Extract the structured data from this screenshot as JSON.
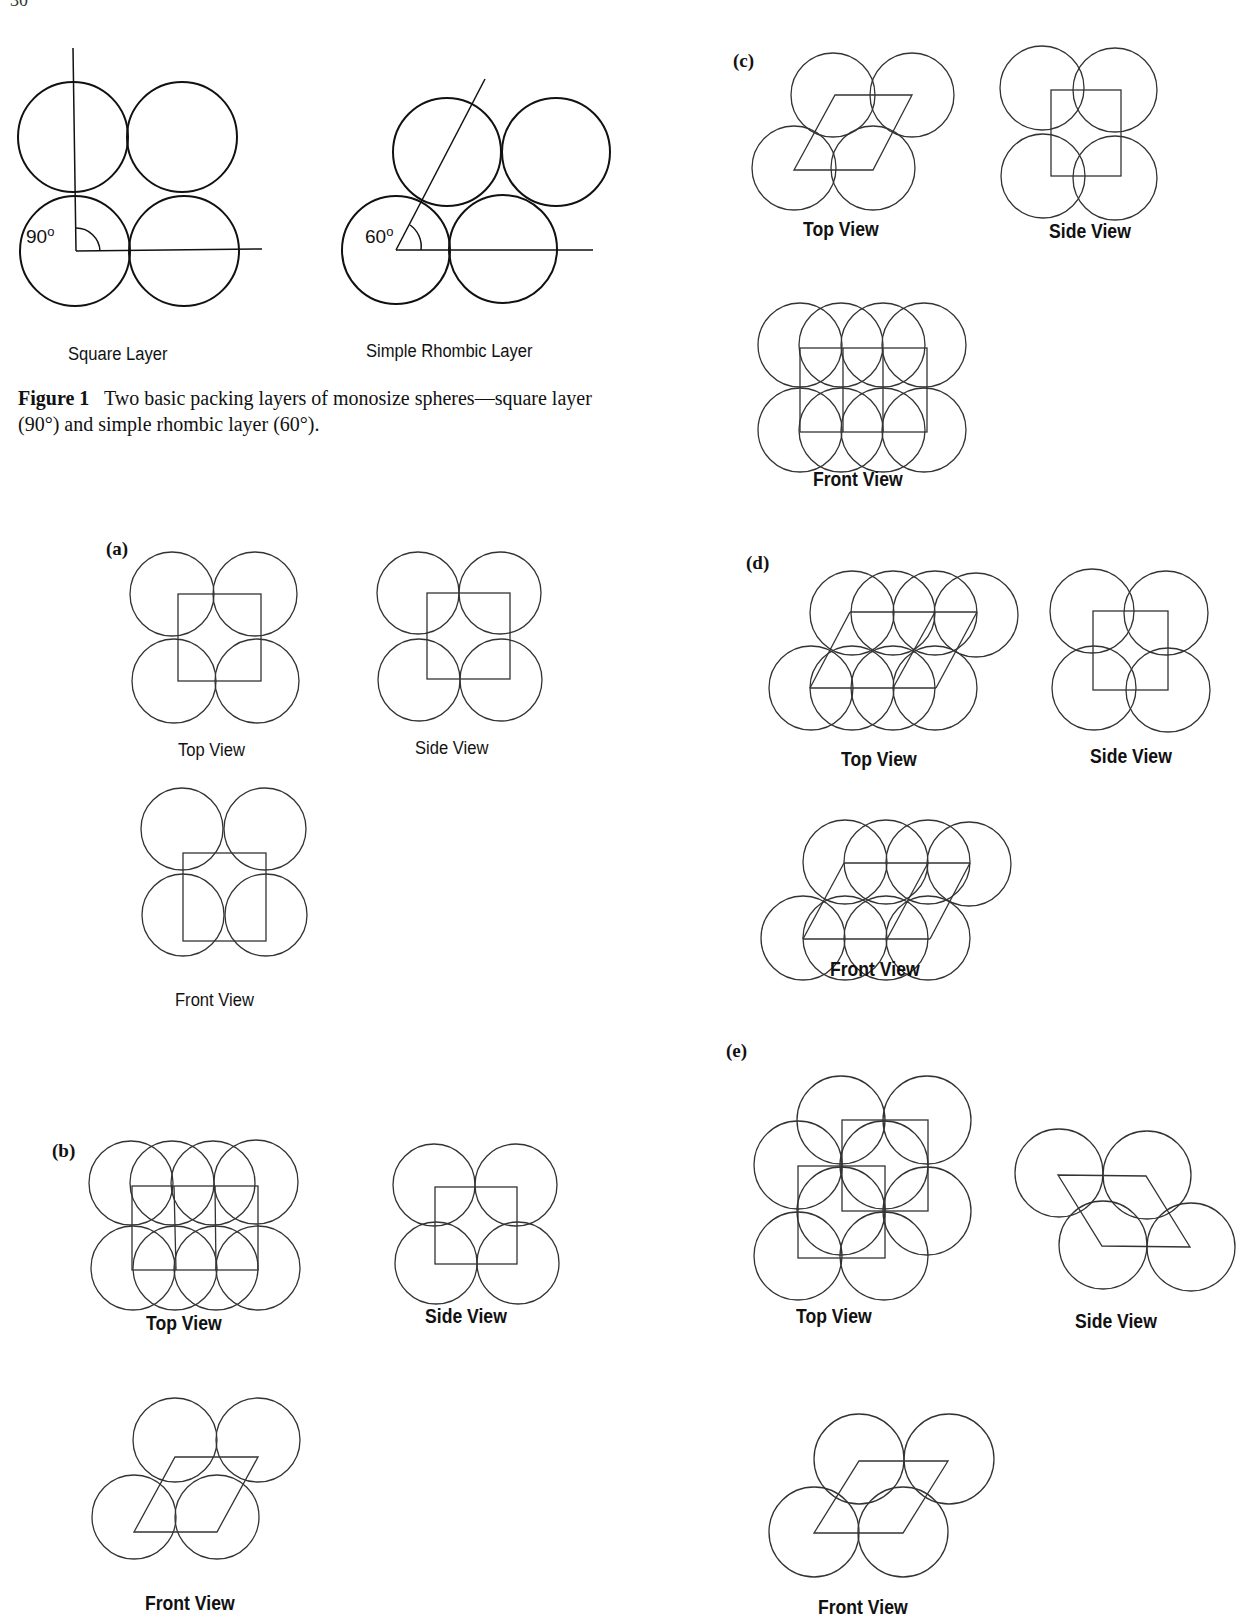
{
  "page": {
    "number": "30"
  },
  "figure1": {
    "square_layer": {
      "label": "Square Layer",
      "angle": "90",
      "degree_symbol": "o"
    },
    "rhombic_layer": {
      "label": "Simple Rhombic Layer",
      "angle": "60",
      "degree_symbol": "o"
    },
    "caption": {
      "label": "Figure 1",
      "text": "Two basic packing layers of monosize spheres—square layer (90°) and simple rhombic layer (60°)."
    }
  },
  "figure2": {
    "panels": [
      {
        "id": "a",
        "tag": "(a)",
        "views": {
          "top": "Top View",
          "side": "Side View",
          "front": "Front View"
        }
      },
      {
        "id": "b",
        "tag": "(b)",
        "views": {
          "top": "Top View",
          "side": "Side View",
          "front": "Front View"
        }
      },
      {
        "id": "c",
        "tag": "(c)",
        "views": {
          "top": "Top View",
          "side": "Side View",
          "front": "Front View"
        }
      },
      {
        "id": "d",
        "tag": "(d)",
        "views": {
          "top": "Top View",
          "side": "Side View",
          "front": "Front View"
        }
      },
      {
        "id": "e",
        "tag": "(e)",
        "views": {
          "top": "Top View",
          "side": "Side View",
          "front": "Front View"
        }
      }
    ]
  },
  "colors": {
    "ink": "#111111",
    "line": "#333333",
    "background": "#ffffff"
  }
}
